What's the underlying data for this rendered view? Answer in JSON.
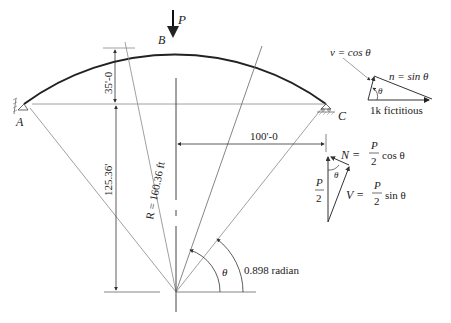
{
  "diagram": {
    "type": "circular arch structural diagram",
    "labels": {
      "load": "P",
      "crown": "B",
      "left_support": "A",
      "right_support": "C",
      "rise": "35'-0",
      "half_span": "100'-0",
      "center_depth": "125.36'",
      "radius": "R = 160.36 ft",
      "theta": "θ",
      "theta_left": "θ",
      "half_angle": "0.898 radian"
    },
    "force_triangle_unit": {
      "v_label": "v = cos θ",
      "n_label": "n = sin θ",
      "theta": "θ",
      "base_label": "1k fictitious"
    },
    "force_triangle_load": {
      "N_label": "N =",
      "N_frac_num": "P",
      "N_frac_den": "2",
      "N_trig": "cos θ",
      "V_label": "V =",
      "V_frac_num": "P",
      "V_frac_den": "2",
      "V_trig": "sin θ",
      "P2_num": "P",
      "P2_den": "2",
      "theta": "θ"
    },
    "colors": {
      "arch": "#222222",
      "construction": "#777777",
      "text": "#222222"
    }
  }
}
